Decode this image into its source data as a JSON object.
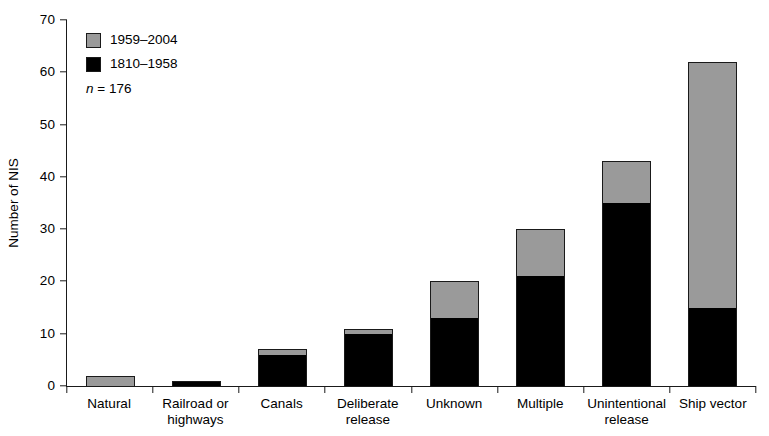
{
  "chart_data": {
    "type": "bar",
    "subtype": "stacked-vertical",
    "title": "",
    "xlabel": "",
    "ylabel": "Number of NIS",
    "ylim": [
      0,
      70
    ],
    "yticks": [
      0,
      10,
      20,
      30,
      40,
      50,
      60,
      70
    ],
    "grid": false,
    "legend_position": "top-left",
    "annotations": [
      "n = 176"
    ],
    "sample_size": 176,
    "categories": [
      "Natural",
      "Railroad or highways",
      "Canals",
      "Deliberate release",
      "Unknown",
      "Multiple",
      "Unintentional release",
      "Ship vector"
    ],
    "category_lines": [
      [
        "Natural"
      ],
      [
        "Railroad or",
        "highways"
      ],
      [
        "Canals"
      ],
      [
        "Deliberate",
        "release"
      ],
      [
        "Unknown"
      ],
      [
        "Multiple"
      ],
      [
        "Unintentional",
        "release"
      ],
      [
        "Ship vector"
      ]
    ],
    "series": [
      {
        "name": "1810–1958",
        "color": "#000000",
        "values": [
          0,
          1,
          6,
          10,
          13,
          21,
          35,
          15
        ]
      },
      {
        "name": "1959–2004",
        "color": "#9a9a9a",
        "values": [
          2,
          0,
          1,
          1,
          7,
          9,
          8,
          47
        ]
      }
    ],
    "totals": [
      2,
      1,
      7,
      11,
      20,
      30,
      43,
      62
    ]
  },
  "legend": {
    "items": [
      {
        "label": "1959–2004",
        "color": "#9a9a9a"
      },
      {
        "label": "1810–1958",
        "color": "#000000"
      }
    ],
    "note_prefix": "n",
    "note_value": "= 176"
  },
  "axis": {
    "y_title": "Number of NIS",
    "y_tick_labels": [
      "0",
      "10",
      "20",
      "30",
      "40",
      "50",
      "60",
      "70"
    ]
  }
}
